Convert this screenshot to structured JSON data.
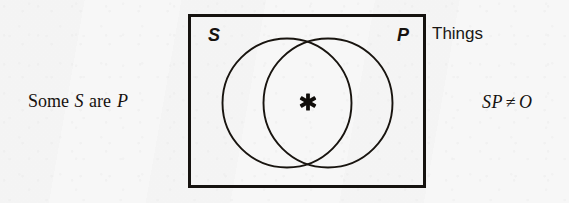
{
  "figure": {
    "type": "venn-diagram",
    "universe_label": "Things",
    "proposition": {
      "prefix": "Some",
      "subject": "S",
      "copula": "are",
      "predicate": "P"
    },
    "formula": {
      "terms": "SP",
      "operator": "≠",
      "value": "O"
    },
    "box": {
      "label_left": "S",
      "label_right": "P"
    },
    "mark": {
      "name": "asterisk",
      "glyph": "✳",
      "region": "S-and-P intersection",
      "meaning": "at least one member exists"
    },
    "colors": {
      "ink": "#16120f",
      "paper": "#f7f7f7"
    }
  }
}
